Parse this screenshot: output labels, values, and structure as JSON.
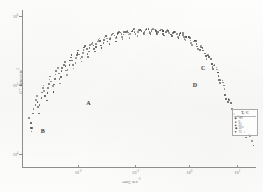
{
  "figure": {
    "kind": "scanned-scientific-plot",
    "ink_color": "#4a4a4a",
    "axis_color": "#8e8e8e",
    "paper_color": "#fbfbfa"
  },
  "axes": {
    "x": {
      "title_main": "ωα",
      "title_sub": "T",
      "title_units": ", sec",
      "title_units_exp": "-1",
      "ticks": [
        {
          "label": "10",
          "exp": "-2",
          "pos_pct": 24.0
        },
        {
          "label": "10",
          "exp": "-1",
          "pos_pct": 48.5
        },
        {
          "label": "10",
          "exp": "0",
          "pos_pct": 71.5
        },
        {
          "label": "10",
          "exp": "1",
          "pos_pct": 92.0
        }
      ],
      "scale": "log",
      "range_decades": [
        -2.8,
        1.4
      ]
    },
    "y": {
      "title_main": "G″",
      "title_units": ", dynes/cm",
      "title_units_exp": "2",
      "ticks": [
        {
          "label": "10",
          "exp": "6",
          "pos_pct": 4.0
        },
        {
          "label": "10",
          "exp": "5",
          "pos_pct": 48.0
        },
        {
          "label": "10",
          "exp": "4",
          "pos_pct": 92.0
        }
      ],
      "scale": "log",
      "range_decades": [
        3.9,
        6.15
      ]
    }
  },
  "annotations": [
    {
      "text": "A",
      "x_pct": 27.5,
      "y_pct": 58.5
    },
    {
      "text": "B",
      "x_pct": 8.0,
      "y_pct": 76.5
    },
    {
      "text": "C",
      "x_pct": 76.5,
      "y_pct": 36.5
    },
    {
      "text": "D",
      "x_pct": 73.0,
      "y_pct": 47.0
    }
  ],
  "legend": {
    "title": "T, °C",
    "entries": [
      {
        "marker": "■",
        "label": "-20"
      },
      {
        "marker": "●",
        "label": "0"
      },
      {
        "marker": "▲",
        "label": "25"
      },
      {
        "marker": "◆",
        "label": "50"
      },
      {
        "marker": "▼",
        "label": "75"
      }
    ]
  },
  "chart_data": {
    "type": "scatter",
    "title": "",
    "subtitle": "",
    "xlabel": "ωαT, sec⁻¹",
    "ylabel": "G″, dynes/cm²",
    "xscale": "log",
    "yscale": "log",
    "xlim": [
      0.0016,
      25
    ],
    "ylim": [
      8000,
      1400000
    ],
    "grid": false,
    "legend_position": "lower-right",
    "series": [
      {
        "name": "master-curve-scatter",
        "marker": "dot",
        "color": "#4a4a4a",
        "points_pct": [
          [
            5.2,
            69.5
          ],
          [
            6.1,
            72.5
          ],
          [
            6.6,
            75.8
          ],
          [
            7.0,
            78.2
          ],
          [
            7.6,
            76.0
          ],
          [
            8.4,
            67.0
          ],
          [
            9.1,
            63.5
          ],
          [
            9.8,
            61.0
          ],
          [
            10.6,
            58.2
          ],
          [
            11.4,
            55.8
          ],
          [
            12.1,
            59.5
          ],
          [
            12.8,
            63.0
          ],
          [
            13.5,
            66.5
          ],
          [
            14.2,
            61.0
          ],
          [
            14.9,
            57.0
          ],
          [
            15.6,
            53.5
          ],
          [
            16.3,
            50.8
          ],
          [
            17.0,
            48.5
          ],
          [
            17.8,
            52.0
          ],
          [
            18.5,
            55.5
          ],
          [
            19.2,
            58.5
          ],
          [
            19.9,
            54.0
          ],
          [
            20.6,
            50.5
          ],
          [
            21.3,
            47.5
          ],
          [
            22.0,
            45.0
          ],
          [
            22.8,
            43.0
          ],
          [
            23.5,
            46.5
          ],
          [
            24.2,
            49.5
          ],
          [
            24.9,
            52.5
          ],
          [
            25.6,
            48.0
          ],
          [
            26.3,
            44.5
          ],
          [
            27.0,
            42.0
          ],
          [
            27.8,
            39.8
          ],
          [
            28.5,
            37.8
          ],
          [
            29.2,
            41.0
          ],
          [
            29.9,
            44.5
          ],
          [
            30.6,
            47.5
          ],
          [
            31.3,
            43.5
          ],
          [
            32.0,
            40.0
          ],
          [
            32.8,
            37.5
          ],
          [
            33.5,
            35.5
          ],
          [
            34.2,
            33.8
          ],
          [
            34.9,
            36.5
          ],
          [
            35.6,
            39.5
          ],
          [
            36.3,
            42.5
          ],
          [
            37.0,
            38.5
          ],
          [
            37.8,
            35.5
          ],
          [
            38.5,
            33.0
          ],
          [
            39.2,
            31.2
          ],
          [
            39.9,
            29.8
          ],
          [
            40.6,
            32.5
          ],
          [
            41.3,
            35.5
          ],
          [
            42.0,
            38.0
          ],
          [
            42.8,
            34.5
          ],
          [
            43.5,
            31.5
          ],
          [
            44.2,
            29.5
          ],
          [
            44.9,
            27.8
          ],
          [
            45.6,
            26.5
          ],
          [
            46.3,
            29.0
          ],
          [
            47.0,
            31.8
          ],
          [
            47.8,
            34.0
          ],
          [
            48.5,
            30.5
          ],
          [
            49.2,
            28.0
          ],
          [
            49.9,
            26.2
          ],
          [
            50.6,
            24.8
          ],
          [
            51.3,
            23.8
          ],
          [
            52.0,
            26.0
          ],
          [
            52.8,
            28.5
          ],
          [
            53.5,
            30.5
          ],
          [
            54.2,
            27.2
          ],
          [
            54.9,
            25.0
          ],
          [
            55.6,
            23.5
          ],
          [
            56.3,
            22.2
          ],
          [
            57.0,
            21.2
          ],
          [
            57.8,
            23.2
          ],
          [
            58.5,
            25.5
          ],
          [
            59.2,
            27.5
          ],
          [
            59.9,
            24.5
          ],
          [
            60.6,
            22.2
          ],
          [
            61.3,
            20.8
          ],
          [
            62.0,
            19.8
          ],
          [
            62.8,
            19.0
          ],
          [
            63.5,
            20.8
          ],
          [
            64.2,
            23.0
          ],
          [
            64.9,
            24.8
          ],
          [
            65.6,
            21.8
          ],
          [
            66.3,
            19.8
          ],
          [
            67.0,
            18.5
          ],
          [
            67.8,
            17.8
          ],
          [
            68.5,
            17.2
          ],
          [
            69.2,
            18.8
          ],
          [
            69.9,
            20.8
          ],
          [
            70.6,
            22.5
          ],
          [
            71.3,
            19.5
          ],
          [
            72.0,
            17.8
          ],
          [
            72.8,
            16.8
          ],
          [
            73.5,
            16.2
          ],
          [
            74.2,
            15.8
          ],
          [
            74.9,
            17.2
          ],
          [
            75.6,
            19.0
          ],
          [
            76.3,
            20.5
          ],
          [
            77.0,
            17.8
          ],
          [
            77.8,
            16.2
          ],
          [
            78.5,
            15.5
          ],
          [
            79.2,
            15.0
          ],
          [
            79.9,
            14.8
          ],
          [
            80.6,
            16.0
          ],
          [
            81.3,
            17.8
          ],
          [
            82.0,
            19.2
          ],
          [
            82.8,
            16.5
          ],
          [
            83.5,
            15.2
          ],
          [
            84.2,
            14.5
          ],
          [
            84.9,
            14.2
          ],
          [
            85.6,
            14.0
          ],
          [
            86.3,
            15.2
          ],
          [
            87.0,
            16.8
          ],
          [
            87.8,
            18.2
          ],
          [
            88.5,
            15.8
          ],
          [
            89.2,
            14.5
          ],
          [
            89.9,
            13.8
          ],
          [
            90.6,
            13.5
          ],
          [
            91.3,
            13.4
          ],
          [
            92.0,
            14.5
          ],
          [
            92.8,
            16.0
          ],
          [
            93.5,
            17.2
          ],
          [
            94.2,
            15.0
          ],
          [
            94.9,
            13.9
          ],
          [
            95.6,
            13.4
          ],
          [
            96.3,
            13.2
          ],
          [
            97.0,
            13.2
          ],
          [
            97.8,
            14.2
          ],
          [
            98.5,
            15.5
          ],
          [
            99.2,
            16.6
          ],
          [
            99.9,
            14.5
          ],
          [
            100.6,
            13.6
          ],
          [
            101.3,
            13.2
          ],
          [
            102.0,
            13.0
          ],
          [
            102.8,
            13.1
          ],
          [
            103.5,
            14.0
          ],
          [
            104.2,
            15.2
          ],
          [
            104.9,
            16.2
          ],
          [
            105.6,
            14.2
          ],
          [
            106.3,
            13.4
          ],
          [
            107.0,
            13.1
          ],
          [
            107.8,
            13.0
          ],
          [
            108.5,
            13.2
          ],
          [
            109.2,
            14.2
          ],
          [
            109.9,
            15.4
          ],
          [
            110.6,
            16.4
          ],
          [
            111.3,
            14.4
          ],
          [
            112.0,
            13.6
          ],
          [
            112.8,
            13.3
          ],
          [
            113.5,
            13.2
          ],
          [
            114.2,
            13.4
          ],
          [
            114.9,
            14.5
          ],
          [
            115.6,
            15.8
          ],
          [
            116.3,
            16.8
          ],
          [
            117.0,
            14.8
          ],
          [
            117.8,
            14.0
          ],
          [
            118.5,
            13.7
          ],
          [
            119.2,
            13.7
          ],
          [
            119.9,
            14.0
          ],
          [
            120.6,
            15.2
          ],
          [
            121.3,
            16.5
          ],
          [
            122.0,
            17.5
          ],
          [
            122.8,
            15.5
          ],
          [
            123.5,
            14.7
          ],
          [
            124.2,
            14.5
          ],
          [
            124.9,
            14.5
          ],
          [
            125.6,
            14.9
          ],
          [
            126.3,
            16.2
          ],
          [
            127.0,
            17.5
          ],
          [
            127.8,
            18.5
          ],
          [
            128.5,
            16.5
          ],
          [
            129.2,
            15.8
          ],
          [
            129.9,
            15.6
          ],
          [
            130.6,
            15.8
          ],
          [
            131.3,
            16.4
          ],
          [
            132.0,
            17.8
          ],
          [
            132.8,
            19.2
          ],
          [
            133.5,
            20.2
          ],
          [
            134.2,
            18.2
          ],
          [
            134.9,
            17.6
          ],
          [
            135.6,
            17.6
          ],
          [
            136.3,
            18.0
          ],
          [
            137.0,
            18.8
          ],
          [
            137.8,
            20.4
          ],
          [
            138.5,
            21.8
          ],
          [
            139.2,
            22.8
          ],
          [
            139.9,
            20.8
          ],
          [
            140.6,
            20.2
          ],
          [
            141.3,
            20.4
          ],
          [
            142.0,
            21.0
          ],
          [
            142.8,
            22.0
          ],
          [
            143.5,
            23.8
          ],
          [
            144.2,
            25.4
          ],
          [
            144.9,
            26.5
          ],
          [
            145.6,
            24.5
          ],
          [
            146.3,
            24.0
          ],
          [
            147.0,
            24.4
          ],
          [
            147.8,
            25.2
          ],
          [
            148.5,
            26.5
          ],
          [
            149.2,
            28.5
          ],
          [
            149.9,
            30.2
          ],
          [
            150.6,
            31.5
          ],
          [
            151.3,
            29.5
          ],
          [
            152.0,
            29.2
          ],
          [
            152.8,
            29.8
          ],
          [
            153.5,
            31.0
          ],
          [
            154.2,
            32.5
          ],
          [
            154.9,
            34.8
          ],
          [
            155.6,
            36.8
          ],
          [
            156.3,
            38.2
          ],
          [
            157.0,
            36.2
          ],
          [
            157.8,
            36.0
          ],
          [
            158.5,
            37.0
          ],
          [
            159.2,
            38.5
          ],
          [
            159.9,
            40.5
          ],
          [
            160.6,
            43.0
          ],
          [
            161.3,
            45.5
          ],
          [
            162.0,
            47.2
          ],
          [
            162.8,
            45.2
          ],
          [
            163.5,
            45.5
          ],
          [
            164.2,
            47.0
          ],
          [
            164.9,
            49.0
          ],
          [
            165.6,
            51.5
          ],
          [
            166.3,
            54.5
          ],
          [
            167.0,
            57.2
          ],
          [
            167.8,
            59.2
          ],
          [
            168.5,
            57.5
          ],
          [
            169.2,
            58.2
          ],
          [
            170.6,
            60.5
          ],
          [
            172.0,
            63.5
          ],
          [
            173.5,
            67.0
          ],
          [
            174.9,
            70.5
          ],
          [
            176.3,
            68.5
          ],
          [
            177.8,
            69.5
          ],
          [
            179.2,
            72.0
          ],
          [
            180.6,
            75.0
          ],
          [
            182.0,
            78.5
          ],
          [
            183.5,
            82.0
          ],
          [
            184.9,
            80.5
          ],
          [
            186.3,
            81.5
          ],
          [
            187.8,
            84.0
          ],
          [
            189.2,
            87.0
          ]
        ]
      }
    ]
  }
}
